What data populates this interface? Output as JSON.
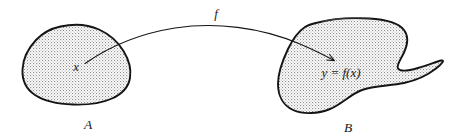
{
  "diagram": {
    "kind": "function-mapping-diagram",
    "domain_blob": {
      "name": "set-a",
      "label": "A",
      "point_label": "x"
    },
    "codomain_blob": {
      "name": "set-b",
      "label": "B",
      "point_label": "y = f(x)"
    },
    "mapping_arrow": {
      "name": "function-arrow",
      "label": "f"
    },
    "colors": {
      "outline": "#141414",
      "stipple": "#9a9a9a",
      "fill": "#ffffff",
      "text": "#1a1a1a",
      "background": "#ffffff"
    }
  }
}
